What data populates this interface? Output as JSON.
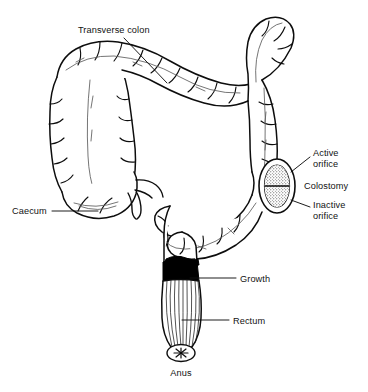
{
  "figure": {
    "style": "black-and-white line drawing",
    "background_color": "#ffffff",
    "ink_color": "#0d0d0d"
  },
  "labels": {
    "transverse_colon": "Transverse colon",
    "caecum": "Caecum",
    "active_orifice_line1": "Active",
    "active_orifice_line2": "orifice",
    "colostomy": "Colostomy",
    "inactive_orifice_line1": "Inactive",
    "inactive_orifice_line2": "orifice",
    "growth": "Growth",
    "rectum": "Rectum",
    "anus": "Anus"
  },
  "parts": [
    {
      "id": "transverse-colon",
      "name": "Transverse colon",
      "labelled": true
    },
    {
      "id": "ascending-colon",
      "name": "Ascending colon",
      "labelled": false
    },
    {
      "id": "descending-colon",
      "name": "Descending colon",
      "labelled": false
    },
    {
      "id": "sigmoid-colon",
      "name": "Sigmoid colon",
      "labelled": false
    },
    {
      "id": "caecum",
      "name": "Caecum",
      "labelled": true
    },
    {
      "id": "appendix",
      "name": "Appendix",
      "labelled": false
    },
    {
      "id": "colostomy",
      "name": "Colostomy",
      "labelled": true
    },
    {
      "id": "active-orifice",
      "name": "Active orifice",
      "labelled": true
    },
    {
      "id": "inactive-orifice",
      "name": "Inactive orifice",
      "labelled": true
    },
    {
      "id": "growth",
      "name": "Growth",
      "labelled": true
    },
    {
      "id": "rectum",
      "name": "Rectum",
      "labelled": true
    },
    {
      "id": "anus",
      "name": "Anus",
      "labelled": true
    }
  ]
}
